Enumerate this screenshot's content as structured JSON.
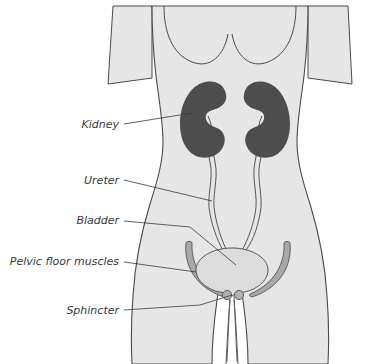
{
  "figure": {
    "background_color": "#ffffff",
    "body_fill": "#e6e6e6",
    "body_stroke": "#4a4a4a",
    "kidney_color": "#4d4d4d",
    "bladder_fill": "#dcdcdc",
    "bladder_stroke": "#555555",
    "muscle_fill": "#a8a8a8",
    "muscle_stroke": "#555555",
    "ureter_stroke": "#555555",
    "sphincter_fill": "#b0b0b0",
    "leader_color": "#3a3a3a",
    "label_color": "#3a3a3a"
  },
  "labels": [
    {
      "id": "kidney",
      "text": "Kidney",
      "text_x": 119,
      "text_y": 128,
      "anchor": "end",
      "leader": "M 124,124 L 192,113"
    },
    {
      "id": "ureter",
      "text": "Ureter",
      "text_x": 119,
      "text_y": 184,
      "anchor": "end",
      "leader": "M 124,180 L 212,201"
    },
    {
      "id": "bladder",
      "text": "Bladder",
      "text_x": 119,
      "text_y": 224,
      "anchor": "end",
      "leader": "M 124,221 L 190,227 L 236,265"
    },
    {
      "id": "pelvic-floor-muscles",
      "text": "Pelvic floor muscles",
      "text_x": 119,
      "text_y": 265,
      "anchor": "end",
      "leader": "M 124,262 L 196,272"
    },
    {
      "id": "sphincter",
      "text": "Sphincter",
      "text_x": 119,
      "text_y": 314,
      "anchor": "end",
      "leader": "M 124,310 L 200,305 L 232,295"
    }
  ],
  "anatomy": {
    "torso_name": "female torso silhouette",
    "kidney_left_name": "left kidney",
    "kidney_right_name": "right kidney",
    "ureter_left_name": "left ureter",
    "ureter_right_name": "right ureter",
    "bladder_name": "urinary bladder",
    "muscle_left_name": "left pelvic floor muscle",
    "muscle_right_name": "right pelvic floor muscle",
    "sphincter_left_name": "left sphincter",
    "sphincter_right_name": "right sphincter",
    "urethra_name": "urethra"
  }
}
